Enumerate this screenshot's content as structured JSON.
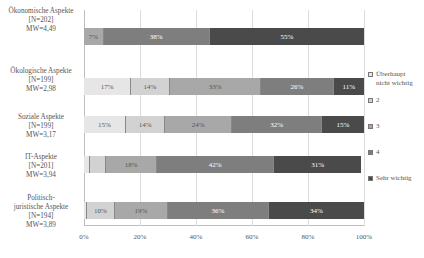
{
  "chart_data": {
    "type": "bar",
    "orientation": "horizontal",
    "stacked": "percent",
    "title": "",
    "xlabel": "",
    "ylabel": "",
    "xlim": [
      0,
      100
    ],
    "grid": true,
    "legend_position": "right",
    "x_ticks": [
      "0%",
      "20%",
      "40%",
      "60%",
      "80%",
      "100%"
    ],
    "categories": [
      "Ökonomische Aspekte [N=202] MW=4,49",
      "Ökologische Aspekte [N=199] MW=2,98",
      "Soziale Aspekte [N=199] MW=3,17",
      "IT-Aspekte [N=201] MW=3,94",
      "Politisch-juristische Aspekte [N=194] MW=3,89"
    ],
    "series": [
      {
        "name": "Überhaupt nicht wichtig",
        "color": "#e6e6e6",
        "values": [
          0,
          17,
          15,
          2,
          1
        ]
      },
      {
        "name": "2",
        "color": "#d2d2d2",
        "values": [
          0,
          14,
          14,
          6,
          10
        ]
      },
      {
        "name": "3",
        "color": "#a8a8a8",
        "values": [
          7,
          33,
          24,
          18,
          19
        ]
      },
      {
        "name": "4",
        "color": "#7e7e7e",
        "values": [
          38,
          26,
          32,
          42,
          36
        ]
      },
      {
        "name": "Sehr wichtig",
        "color": "#4a4a4a",
        "values": [
          55,
          11,
          15,
          31,
          34
        ]
      }
    ],
    "data_labels": [
      [
        "",
        "",
        "7%",
        "38%",
        "55%"
      ],
      [
        "17%",
        "14%",
        "33%",
        "26%",
        "11%"
      ],
      [
        "15%",
        "14%",
        "24%",
        "32%",
        "15%"
      ],
      [
        "",
        "",
        "18%",
        "42%",
        "31%"
      ],
      [
        "",
        "10%",
        "19%",
        "36%",
        "34%"
      ]
    ]
  },
  "rows": [
    {
      "label_lines": [
        "Ökonomische Aspekte",
        "[N=202]",
        "MW=4,49"
      ],
      "top": 28,
      "label_top": 7
    },
    {
      "label_lines": [
        "Ökologische Aspekte",
        "[N=199]",
        "MW=2,98"
      ],
      "top": 78,
      "label_top": 67
    },
    {
      "label_lines": [
        "Soziale Aspekte",
        "[N=199]",
        "MW=3,17"
      ],
      "top": 116,
      "label_top": 113
    },
    {
      "label_lines": [
        "IT-Aspekte",
        "[N=201]",
        "MW=3,94"
      ],
      "top": 156,
      "label_top": 153
    },
    {
      "label_lines": [
        "Politisch-",
        "juristische Aspekte",
        "[N=194]",
        "MW=3,89"
      ],
      "top": 202,
      "label_top": 194
    }
  ],
  "legend": [
    {
      "label": "Überhaupt nicht wichtig",
      "label_lines": [
        "Überhaupt",
        "nicht wichtig"
      ],
      "top": 0
    },
    {
      "label": "2",
      "label_lines": [
        "2"
      ],
      "top": 26
    },
    {
      "label": "3",
      "label_lines": [
        "3"
      ],
      "top": 52
    },
    {
      "label": "4",
      "label_lines": [
        "4"
      ],
      "top": 78
    },
    {
      "label": "Sehr wichtig",
      "label_lines": [
        "Sehr wichtig"
      ],
      "top": 104
    }
  ],
  "text_colors": {
    "light": "#555555",
    "dark": "#ffffff"
  }
}
